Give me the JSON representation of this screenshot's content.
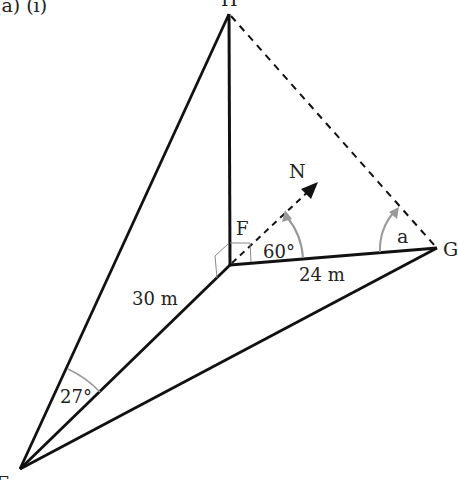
{
  "diagram": {
    "part_label": "(a)   (i)",
    "points": {
      "H": {
        "label": "H",
        "x": 229,
        "y": 14
      },
      "F": {
        "label": "F",
        "x": 230,
        "y": 265
      },
      "G": {
        "label": "G",
        "x": 437,
        "y": 248
      },
      "E": {
        "label": "E",
        "x": 20,
        "y": 469
      }
    },
    "north_label": "N",
    "lengths": {
      "FE": "30 m",
      "FG": "24 m"
    },
    "angles": {
      "north_to_FG": "60°",
      "at_G": "a",
      "at_E": "27°"
    },
    "colors": {
      "line": "#111111",
      "arc": "#999999",
      "right_angle": "#888888"
    }
  }
}
